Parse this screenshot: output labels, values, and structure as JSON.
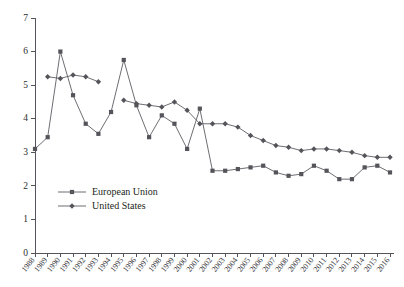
{
  "chart_data": {
    "type": "line",
    "title": "",
    "subtitle": "",
    "xlabel": "",
    "ylabel": "",
    "xlim": [
      1988,
      2016
    ],
    "ylim": [
      0,
      7
    ],
    "ytick_labels": [
      "0",
      "1",
      "2",
      "3",
      "4",
      "5",
      "6",
      "7"
    ],
    "yticks": [
      0,
      1,
      2,
      3,
      4,
      5,
      6,
      7
    ],
    "grid": false,
    "legend_position": "inside-lower-left",
    "x": [
      1988,
      1989,
      1990,
      1991,
      1992,
      1993,
      1994,
      1995,
      1996,
      1997,
      1998,
      1999,
      2000,
      2001,
      2002,
      2003,
      2004,
      2005,
      2006,
      2007,
      2008,
      2009,
      2010,
      2011,
      2012,
      2013,
      2014,
      2015,
      2016
    ],
    "categories": [
      "1988",
      "1989",
      "1990",
      "1991",
      "1992",
      "1993",
      "1994",
      "1995",
      "1996",
      "1997",
      "1998",
      "1999",
      "2000",
      "2001",
      "2002",
      "2003",
      "2004",
      "2005",
      "2006",
      "2007",
      "2008",
      "2009",
      "2010",
      "2011",
      "2012",
      "2013",
      "2014",
      "2015",
      "2016"
    ],
    "series": [
      {
        "name": "European Union",
        "marker": "square",
        "color": "#55545a",
        "values": [
          3.1,
          3.45,
          6.0,
          4.7,
          3.85,
          3.55,
          4.2,
          5.75,
          4.4,
          3.45,
          4.1,
          3.85,
          3.1,
          4.3,
          2.45,
          2.45,
          2.5,
          2.55,
          2.6,
          2.4,
          2.3,
          2.35,
          2.6,
          2.45,
          2.2,
          2.2,
          2.55,
          2.6,
          2.4
        ]
      },
      {
        "name": "United States",
        "marker": "diamond",
        "color": "#55545a",
        "values": [
          null,
          5.25,
          5.2,
          5.3,
          5.25,
          5.1,
          null,
          4.55,
          4.45,
          4.4,
          4.35,
          4.5,
          4.25,
          3.85,
          3.85,
          3.85,
          3.75,
          3.5,
          3.35,
          3.2,
          3.15,
          3.05,
          3.1,
          3.1,
          3.05,
          3.0,
          2.9,
          2.85,
          2.85
        ]
      }
    ]
  },
  "legend": {
    "items": [
      {
        "label": "European Union",
        "marker": "square"
      },
      {
        "label": "United States",
        "marker": "diamond"
      }
    ]
  }
}
